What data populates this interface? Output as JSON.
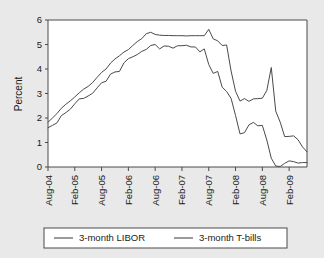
{
  "chart_data": {
    "type": "line",
    "title": "",
    "xlabel": "",
    "ylabel": "Percent",
    "ylim": [
      0,
      6
    ],
    "yticks": [
      0,
      1,
      2,
      3,
      4,
      5,
      6
    ],
    "ytick_labels": [
      "0",
      "1",
      "2",
      "3",
      "4",
      "5",
      "6"
    ],
    "grid": false,
    "legend_position": "bottom",
    "x_start": "Aug-04",
    "x_end": "Jun-09",
    "xtick_labels": [
      "Aug-04",
      "Feb-05",
      "Aug-05",
      "Feb-06",
      "Aug-06",
      "Feb-07",
      "Aug-07",
      "Feb-08",
      "Aug-08",
      "Feb-09"
    ],
    "x_months": [
      "Aug-04",
      "Sep-04",
      "Oct-04",
      "Nov-04",
      "Dec-04",
      "Jan-05",
      "Feb-05",
      "Mar-05",
      "Apr-05",
      "May-05",
      "Jun-05",
      "Jul-05",
      "Aug-05",
      "Sep-05",
      "Oct-05",
      "Nov-05",
      "Dec-05",
      "Jan-06",
      "Feb-06",
      "Mar-06",
      "Apr-06",
      "May-06",
      "Jun-06",
      "Jul-06",
      "Aug-06",
      "Sep-06",
      "Oct-06",
      "Nov-06",
      "Dec-06",
      "Jan-07",
      "Feb-07",
      "Mar-07",
      "Apr-07",
      "May-07",
      "Jun-07",
      "Jul-07",
      "Aug-07",
      "Sep-07",
      "Oct-07",
      "Nov-07",
      "Dec-07",
      "Jan-08",
      "Feb-08",
      "Mar-08",
      "Apr-08",
      "May-08",
      "Jun-08",
      "Jul-08",
      "Aug-08",
      "Sep-08",
      "Oct-08",
      "Nov-08",
      "Dec-08",
      "Jan-09",
      "Feb-09",
      "Mar-09",
      "Apr-09",
      "May-09",
      "Jun-09"
    ],
    "series": [
      {
        "name": "3-month LIBOR",
        "color": "#4a4a4a",
        "values": [
          1.83,
          2.0,
          2.18,
          2.4,
          2.56,
          2.7,
          2.86,
          3.03,
          3.18,
          3.29,
          3.45,
          3.66,
          3.86,
          4.0,
          4.24,
          4.41,
          4.54,
          4.69,
          4.79,
          4.96,
          5.12,
          5.24,
          5.44,
          5.5,
          5.41,
          5.38,
          5.37,
          5.37,
          5.36,
          5.36,
          5.36,
          5.35,
          5.36,
          5.36,
          5.36,
          5.36,
          5.62,
          5.23,
          5.15,
          4.96,
          4.98,
          3.92,
          3.09,
          2.69,
          2.79,
          2.68,
          2.78,
          2.79,
          2.81,
          3.12,
          4.06,
          2.28,
          1.83,
          1.24,
          1.25,
          1.27,
          1.11,
          0.82,
          0.62
        ]
      },
      {
        "name": "3-month T-bills",
        "color": "#4a4a4a",
        "values": [
          1.6,
          1.7,
          1.8,
          2.1,
          2.22,
          2.36,
          2.58,
          2.78,
          2.8,
          2.9,
          3.01,
          3.23,
          3.44,
          3.5,
          3.79,
          3.88,
          3.9,
          4.25,
          4.42,
          4.5,
          4.59,
          4.72,
          4.8,
          4.96,
          5.0,
          4.82,
          4.94,
          4.93,
          4.85,
          4.95,
          4.95,
          4.97,
          4.9,
          4.9,
          4.7,
          4.82,
          4.18,
          3.82,
          3.9,
          3.26,
          3.08,
          2.8,
          2.1,
          1.35,
          1.4,
          1.72,
          1.82,
          1.68,
          1.7,
          1.1,
          0.36,
          0.04,
          0.02,
          0.15,
          0.25,
          0.22,
          0.16,
          0.18,
          0.18
        ]
      }
    ]
  },
  "legend": {
    "items": [
      {
        "label": "3-month LIBOR"
      },
      {
        "label": "3-month T-bills"
      }
    ]
  },
  "axes": {
    "y_title": "Percent"
  }
}
